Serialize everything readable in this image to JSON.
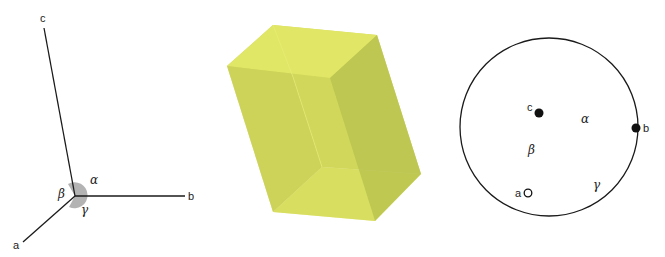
{
  "panels": {
    "axes": {
      "labels": {
        "a": "a",
        "b": "b",
        "c": "c"
      },
      "angles": {
        "alpha": "α",
        "beta": "β",
        "gamma": "γ"
      },
      "angle_marker_color": "#a0a0a0"
    },
    "crystal": {
      "shape": "parallelepiped",
      "colors": {
        "light": "#e4ea6a",
        "mid": "#cdd55a",
        "dark": "#b8c24e",
        "top": "#dfe566"
      }
    },
    "projection": {
      "labels": {
        "a": "a",
        "b": "b",
        "c": "c"
      },
      "angles": {
        "alpha": "α",
        "beta": "β",
        "gamma": "γ"
      },
      "points": [
        {
          "name": "c",
          "style": "filled"
        },
        {
          "name": "b",
          "style": "filled"
        },
        {
          "name": "a",
          "style": "open"
        }
      ]
    }
  }
}
